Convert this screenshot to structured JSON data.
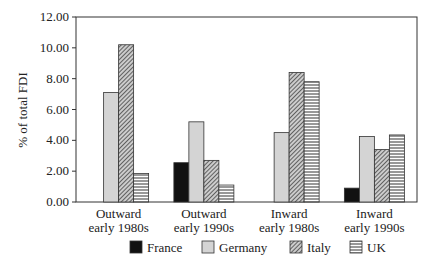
{
  "chart_data": {
    "type": "bar",
    "title": "",
    "xlabel": "",
    "ylabel": "% of total FDI",
    "ylim": [
      0,
      12
    ],
    "yticks": [
      "0.00",
      "2.00",
      "4.00",
      "6.00",
      "8.00",
      "10.00",
      "12.00"
    ],
    "categories": [
      [
        "Outward",
        "early 1980s"
      ],
      [
        "Outward",
        "early 1990s"
      ],
      [
        "Inward",
        "early 1980s"
      ],
      [
        "Inward",
        "early 1990s"
      ]
    ],
    "series": [
      {
        "name": "France",
        "pattern": "solid-black",
        "values": [
          0,
          2.55,
          0,
          0.9
        ]
      },
      {
        "name": "Germany",
        "pattern": "light-gray",
        "values": [
          7.1,
          5.2,
          4.5,
          4.25
        ]
      },
      {
        "name": "Italy",
        "pattern": "diagonal-hatch",
        "values": [
          10.2,
          2.7,
          8.4,
          3.4
        ]
      },
      {
        "name": "UK",
        "pattern": "horizontal-lines",
        "values": [
          1.85,
          1.1,
          7.8,
          4.35
        ]
      }
    ],
    "legend_position": "bottom",
    "grid": false
  }
}
